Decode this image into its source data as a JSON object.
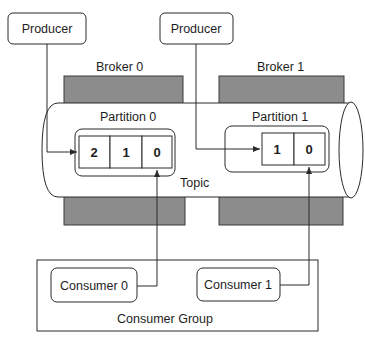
{
  "diagram": {
    "colors": {
      "stroke": "#2a2a2a",
      "broker_fill": "#8c8c8c",
      "background": "#ffffff"
    },
    "producers": [
      {
        "label": "Producer"
      },
      {
        "label": "Producer"
      }
    ],
    "brokers": [
      {
        "label": "Broker 0"
      },
      {
        "label": "Broker 1"
      }
    ],
    "topic": {
      "label": "Topic"
    },
    "partitions": [
      {
        "label": "Partition 0",
        "offsets": [
          "2",
          "1",
          "0"
        ]
      },
      {
        "label": "Partition 1",
        "offsets": [
          "1",
          "0"
        ]
      }
    ],
    "consumer_group": {
      "label": "Consumer Group",
      "consumers": [
        {
          "label": "Consumer 0"
        },
        {
          "label": "Consumer 1"
        }
      ]
    }
  }
}
